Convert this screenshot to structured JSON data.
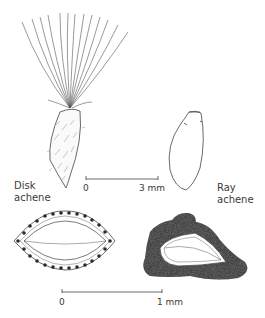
{
  "figure": {
    "labels": {
      "disk_achene": [
        "Disk",
        "achene"
      ],
      "ray_achene": [
        "Ray",
        "achene"
      ]
    },
    "scale_bars": [
      {
        "start_label": "0",
        "end_label": "3 mm",
        "applies_to": "whole achenes"
      },
      {
        "start_label": "0",
        "end_label": "1 mm",
        "applies_to": "cross-sections"
      }
    ],
    "parts": [
      "pappus-bristles",
      "disk-achene-body",
      "ray-achene-body",
      "disk-achene-cross-section",
      "ray-achene-cross-section"
    ],
    "colors": {
      "ink": "#3a3a3a",
      "stipple": "#4a4a4a",
      "background": "#ffffff"
    }
  }
}
